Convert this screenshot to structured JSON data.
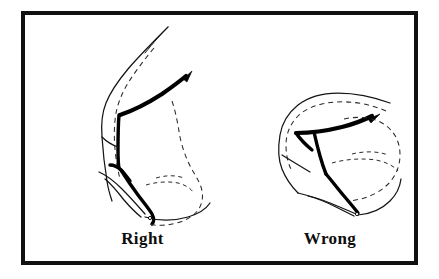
{
  "figure": {
    "background_color": "#ffffff",
    "border_color": "#111111",
    "ink_color": "#000000",
    "panels": [
      {
        "id": "right",
        "caption": "Right",
        "description": "Profile outline of a face in side view with a dark instrument line angled upward toward the nose and a dashed reference outline."
      },
      {
        "id": "wrong",
        "caption": "Wrong",
        "description": "Profile outline of a face in side view with the dark instrument line angled horizontally and a dashed reference outline."
      }
    ]
  },
  "captions": {
    "left": "Right",
    "right": "Wrong"
  }
}
